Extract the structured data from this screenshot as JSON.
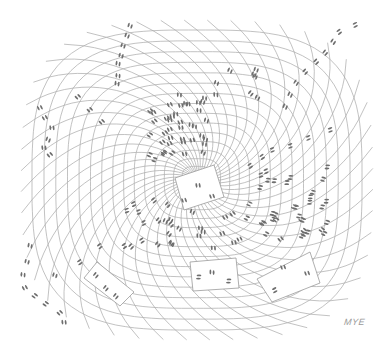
{
  "artwork": {
    "type": "pen-and-ink cartoon",
    "subject": "swirling warped floor grid with footprints converging on a central tile",
    "background": "#ffffff",
    "line_color": "#a8a8a8",
    "footprint_color": "#6e6e6e",
    "tile_fill": "#ffffff",
    "tile_stroke": "#9a9a9a"
  },
  "signature": {
    "text": "MYE"
  },
  "grid": {
    "center": [
      197,
      180
    ],
    "spokes": 48,
    "rings": 15,
    "inner_radius": 8,
    "outer_rx": 165,
    "outer_ry": 150,
    "twist": 0.55
  },
  "tiles": [
    {
      "name": "center-tile",
      "points": [
        [
          175,
          178
        ],
        [
          214,
          165
        ],
        [
          224,
          197
        ],
        [
          184,
          210
        ]
      ],
      "prints": [
        [
          198,
          185,
          -10
        ],
        [
          184,
          200,
          -20
        ],
        [
          212,
          196,
          -20
        ]
      ]
    },
    {
      "name": "bottom-left-tile",
      "points": [
        [
          84,
          278
        ],
        [
          97,
          262
        ],
        [
          134,
          292
        ],
        [
          120,
          306
        ]
      ],
      "prints": [
        [
          96,
          275,
          40
        ],
        [
          106,
          288,
          40
        ],
        [
          116,
          296,
          40
        ]
      ]
    },
    {
      "name": "bottom-center-tile",
      "points": [
        [
          190,
          262
        ],
        [
          236,
          258
        ],
        [
          239,
          288
        ],
        [
          193,
          291
        ]
      ],
      "prints": [
        [
          199,
          277,
          90
        ],
        [
          212,
          272,
          0
        ],
        [
          229,
          281,
          90
        ]
      ]
    },
    {
      "name": "bottom-right-tile",
      "points": [
        [
          257,
          279
        ],
        [
          310,
          252
        ],
        [
          320,
          283
        ],
        [
          272,
          302
        ]
      ],
      "prints": [
        [
          275,
          290,
          60
        ],
        [
          283,
          267,
          -20
        ],
        [
          307,
          273,
          -20
        ]
      ]
    }
  ],
  "footprint_trails": [
    {
      "name": "top-left-trail",
      "points": [
        [
          130,
          26
        ],
        [
          127,
          36
        ],
        [
          123,
          46
        ],
        [
          121,
          56
        ],
        [
          118,
          64
        ],
        [
          118,
          76
        ],
        [
          117,
          84
        ]
      ]
    },
    {
      "name": "top-right-trail",
      "points": [
        [
          355,
          25
        ],
        [
          339,
          32
        ],
        [
          333,
          42
        ],
        [
          325,
          53
        ],
        [
          316,
          62
        ],
        [
          305,
          72
        ],
        [
          296,
          83
        ],
        [
          290,
          95
        ],
        [
          285,
          107
        ]
      ]
    },
    {
      "name": "left-trail",
      "points": [
        [
          40,
          108
        ],
        [
          45,
          118
        ],
        [
          52,
          128
        ],
        [
          48,
          140
        ],
        [
          44,
          148
        ],
        [
          50,
          155
        ]
      ]
    },
    {
      "name": "mid-left-trail",
      "points": [
        [
          78,
          97
        ],
        [
          90,
          110
        ],
        [
          102,
          122
        ]
      ]
    },
    {
      "name": "bottom-left-trail",
      "points": [
        [
          30,
          246
        ],
        [
          27,
          262
        ],
        [
          23,
          275
        ],
        [
          25,
          288
        ],
        [
          35,
          296
        ],
        [
          46,
          304
        ],
        [
          60,
          313
        ],
        [
          64,
          322
        ],
        [
          55,
          275
        ],
        [
          80,
          262
        ],
        [
          100,
          246
        ]
      ]
    },
    {
      "name": "right-mid-trail",
      "points": [
        [
          330,
          130
        ],
        [
          308,
          138
        ],
        [
          290,
          146
        ],
        [
          272,
          150
        ],
        [
          262,
          157
        ],
        [
          250,
          166
        ]
      ]
    }
  ],
  "footprint_clusters": [
    {
      "name": "upper-cluster",
      "bounds": [
        150,
        95,
        210,
        160
      ],
      "count": 40
    },
    {
      "name": "right-cluster",
      "bounds": [
        258,
        165,
        330,
        240
      ],
      "count": 34
    },
    {
      "name": "lower-cluster",
      "bounds": [
        110,
        200,
        250,
        250
      ],
      "count": 30
    },
    {
      "name": "upper-right-cluster",
      "bounds": [
        210,
        70,
        260,
        110
      ],
      "count": 8
    }
  ]
}
